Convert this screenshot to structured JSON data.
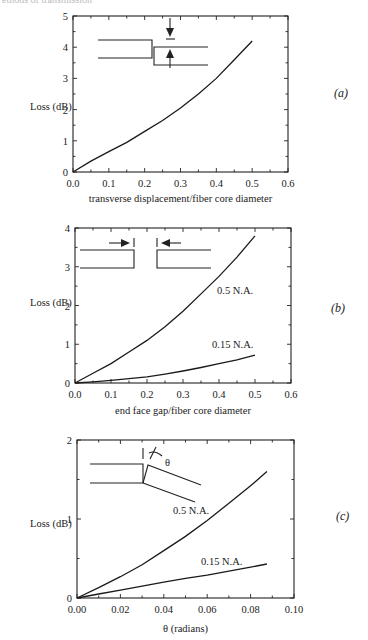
{
  "header": {
    "text": "ethods of transmission"
  },
  "panel_labels": [
    "(a)",
    "(b)",
    "(c)"
  ],
  "chart_data": [
    {
      "type": "line",
      "panel": "(a)",
      "title": "",
      "xlabel": "transverse displacement/fiber core diameter",
      "ylabel": "Loss (dB)",
      "xlim": [
        0.0,
        0.6
      ],
      "ylim": [
        0,
        5
      ],
      "xticks": [
        "0.0",
        "0.1",
        "0.2",
        "0.3",
        "0.4",
        "0.5",
        "0.6"
      ],
      "yticks": [
        "0",
        "1",
        "2",
        "3",
        "4",
        "5"
      ],
      "grid": false,
      "inset": "lateral offset diagram: two fibers displaced transversely, arrows indicating offset",
      "series": [
        {
          "name": "",
          "x": [
            0.0,
            0.05,
            0.1,
            0.15,
            0.2,
            0.25,
            0.3,
            0.35,
            0.4,
            0.45,
            0.5
          ],
          "y": [
            0.0,
            0.35,
            0.65,
            0.95,
            1.3,
            1.65,
            2.05,
            2.5,
            3.0,
            3.6,
            4.2
          ]
        }
      ]
    },
    {
      "type": "line",
      "panel": "(b)",
      "title": "",
      "xlabel": "end face gap/fiber core diameter",
      "ylabel": "Loss (dB)",
      "xlim": [
        0.0,
        0.6
      ],
      "ylim": [
        0,
        4
      ],
      "xticks": [
        "0.0",
        "0.1",
        "0.2",
        "0.3",
        "0.4",
        "0.5",
        "0.6"
      ],
      "yticks": [
        "0",
        "1",
        "2",
        "3",
        "4"
      ],
      "grid": false,
      "inset": "end gap diagram: two fibers separated by a gap, arrows pointing toward the gap",
      "series": [
        {
          "name": "0.5 N.A.",
          "x": [
            0.0,
            0.05,
            0.1,
            0.15,
            0.2,
            0.25,
            0.3,
            0.35,
            0.4,
            0.45,
            0.5
          ],
          "y": [
            0.0,
            0.25,
            0.5,
            0.8,
            1.1,
            1.45,
            1.85,
            2.3,
            2.75,
            3.25,
            3.8
          ]
        },
        {
          "name": "0.15 N.A.",
          "x": [
            0.0,
            0.05,
            0.1,
            0.15,
            0.2,
            0.25,
            0.3,
            0.35,
            0.4,
            0.45,
            0.5
          ],
          "y": [
            0.0,
            0.03,
            0.07,
            0.11,
            0.16,
            0.23,
            0.31,
            0.4,
            0.5,
            0.6,
            0.72
          ]
        }
      ]
    },
    {
      "type": "line",
      "panel": "(c)",
      "title": "",
      "xlabel": "θ (radians)",
      "ylabel": "Loss (dB)",
      "xlim": [
        0.0,
        0.1
      ],
      "ylim": [
        0,
        2
      ],
      "xticks": [
        "0.00",
        "0.02",
        "0.04",
        "0.06",
        "0.08",
        "0.10"
      ],
      "yticks": [
        "0",
        "1",
        "2"
      ],
      "grid": false,
      "inset": "angular misalignment diagram: second fiber tilted by angle θ",
      "series": [
        {
          "name": "0.5 N.A.",
          "x": [
            0.0,
            0.01,
            0.02,
            0.03,
            0.04,
            0.05,
            0.06,
            0.07,
            0.08,
            0.0875
          ],
          "y": [
            0.0,
            0.13,
            0.27,
            0.42,
            0.6,
            0.78,
            0.98,
            1.2,
            1.42,
            1.6
          ]
        },
        {
          "name": "0.15 N.A.",
          "x": [
            0.0,
            0.01,
            0.02,
            0.03,
            0.04,
            0.05,
            0.06,
            0.07,
            0.08,
            0.0875
          ],
          "y": [
            0.0,
            0.05,
            0.1,
            0.15,
            0.2,
            0.25,
            0.29,
            0.34,
            0.39,
            0.43
          ]
        }
      ]
    }
  ]
}
